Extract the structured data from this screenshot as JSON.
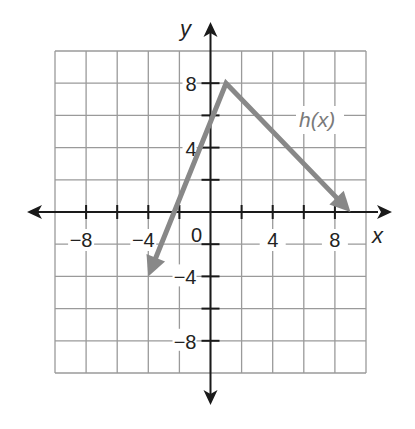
{
  "chart_data": {
    "type": "line",
    "title": "",
    "xlabel": "x",
    "ylabel": "y",
    "xlim": [
      -10,
      10
    ],
    "ylim": [
      -10,
      10
    ],
    "grid": true,
    "grid_step": 2,
    "x_ticks": [
      -8,
      -4,
      0,
      4,
      8
    ],
    "y_ticks": [
      8,
      4,
      -4,
      -8
    ],
    "x_tick_labels": [
      "−8",
      "−4",
      "4",
      "8"
    ],
    "y_tick_labels": [
      "8",
      "4",
      "−4",
      "−8"
    ],
    "origin_label": "0",
    "series": [
      {
        "name": "h(x)",
        "label": "h(x)",
        "color": "#888888",
        "points": [
          [
            -4,
            -4
          ],
          [
            1,
            8
          ],
          [
            9,
            0
          ]
        ],
        "x": [
          -4,
          1,
          9
        ],
        "y": [
          -4,
          8,
          0
        ],
        "arrow_ends": true
      }
    ],
    "annotations": [
      {
        "text": "h(x)",
        "x": 6,
        "y": 6
      }
    ]
  },
  "colors": {
    "axis": "#1a1a1a",
    "grid": "#9a9a9a",
    "series": "#888888",
    "series_label": "#7a7a7a"
  }
}
